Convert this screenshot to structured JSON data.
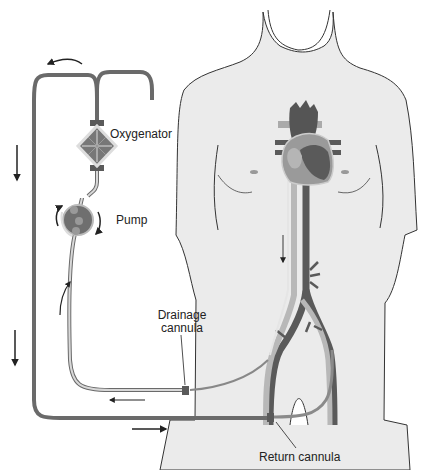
{
  "diagram": {
    "type": "ECMO circuit (veno-arterial extracorporeal membrane oxygenation)",
    "labels": {
      "oxygenator": "Oxygenator",
      "pump": "Pump",
      "drainage_cannula_line1": "Drainage",
      "drainage_cannula_line2": "cannula",
      "return_cannula": "Return cannula"
    },
    "components": [
      "oxygenator",
      "pump",
      "drainage-cannula",
      "return-cannula",
      "heart",
      "vena-cava",
      "aorta",
      "femoral-vessels",
      "tubing"
    ],
    "flow_arrows": [
      "top-curved-left",
      "left-down-upper",
      "left-down-lower",
      "bottom-right",
      "drainage-left",
      "drainage-up",
      "pump-rotation",
      "ivc-down"
    ],
    "colors": {
      "body_fill": "#ebebeb",
      "body_outline": "#333333",
      "tube_dark": "#6a6a6a",
      "tube_light": "#cfcfcf",
      "vessel_dark": "#5a5a5a",
      "vessel_light": "#b8b8b8",
      "arrow": "#222222"
    }
  }
}
